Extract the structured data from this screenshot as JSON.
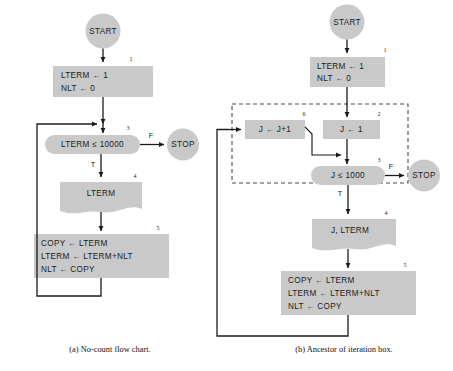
{
  "figure": {
    "background_color": "#ffffff",
    "shape_fill": "#c9c9c9",
    "line_color": "#1b1b1b",
    "dashed_color": "#4a4a4a"
  },
  "panel_a": {
    "caption": "(a)  No-count flow chart.",
    "start_label": "START",
    "stop_label": "STOP",
    "box1": {
      "number": "1",
      "line1": "LTERM ← 1",
      "line2": "NLT ← 0"
    },
    "decision3": {
      "number": "3",
      "text": "LTERM  ≤  10000",
      "false_label": "F",
      "true_label": "T"
    },
    "doc4": {
      "number": "4",
      "text": "LTERM"
    },
    "box5": {
      "number": "5",
      "line1": "COPY ← LTERM",
      "line2": "LTERM ← LTERM+NLT",
      "line3": "NLT ← COPY"
    }
  },
  "panel_b": {
    "caption": "(b)  Ancestor of iteration box.",
    "start_label": "START",
    "stop_label": "STOP",
    "box1": {
      "number": "1",
      "line1": "LTERM ← 1",
      "line2": "NLT ← 0"
    },
    "box2": {
      "number": "2",
      "text": "J ← 1"
    },
    "box6": {
      "number": "6",
      "text": "J ← J+1"
    },
    "decision3": {
      "number": "3",
      "text": "J  ≤  1000",
      "false_label": "F",
      "true_label": "T"
    },
    "doc4": {
      "number": "4",
      "text": "J,  LTERM"
    },
    "box5": {
      "number": "5",
      "line1": "COPY ← LTERM",
      "line2": "LTERM ← LTERM+NLT",
      "line3": "NLT ← COPY"
    }
  }
}
